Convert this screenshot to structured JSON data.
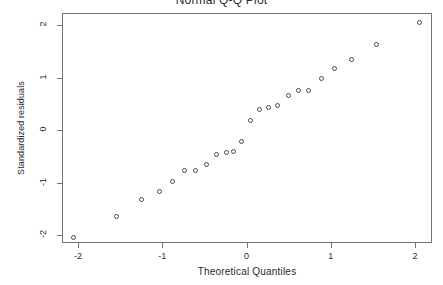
{
  "chart_data": {
    "type": "scatter",
    "title": "Normal Q-Q Plot",
    "xlabel": "Theoretical Quantiles",
    "ylabel": "Standardized residuals",
    "xlim": [
      -2.2,
      2.2
    ],
    "ylim": [
      -2.2,
      2.2
    ],
    "grid": false,
    "legend": null,
    "xticks": [
      -2,
      -1,
      0,
      1,
      2
    ],
    "xtick_labels": [
      "-2",
      "-1",
      "0",
      "1",
      "2"
    ],
    "yticks": [
      2,
      1,
      0,
      -1,
      -2
    ],
    "ytick_labels": [
      "2",
      "1",
      "0",
      "-1",
      "-2"
    ],
    "marker": "open-circle",
    "marker_color": "#4a4a4a",
    "frame_color": "#737373",
    "background": "#ffffff",
    "n_points": 24,
    "points": [
      {
        "x": -2.05,
        "y": -2.05
      },
      {
        "x": -1.54,
        "y": -1.64
      },
      {
        "x": -1.25,
        "y": -1.33
      },
      {
        "x": -1.03,
        "y": -1.17
      },
      {
        "x": -0.88,
        "y": -0.99
      },
      {
        "x": -0.73,
        "y": -0.77
      },
      {
        "x": -0.61,
        "y": -0.77
      },
      {
        "x": -0.48,
        "y": -0.65
      },
      {
        "x": -0.36,
        "y": -0.46
      },
      {
        "x": -0.24,
        "y": -0.42
      },
      {
        "x": -0.15,
        "y": -0.4
      },
      {
        "x": -0.06,
        "y": -0.21
      },
      {
        "x": 0.05,
        "y": 0.18
      },
      {
        "x": 0.15,
        "y": 0.39
      },
      {
        "x": 0.26,
        "y": 0.42
      },
      {
        "x": 0.37,
        "y": 0.46
      },
      {
        "x": 0.5,
        "y": 0.65
      },
      {
        "x": 0.62,
        "y": 0.76
      },
      {
        "x": 0.74,
        "y": 0.76
      },
      {
        "x": 0.89,
        "y": 0.98
      },
      {
        "x": 1.04,
        "y": 1.17
      },
      {
        "x": 1.25,
        "y": 1.34
      },
      {
        "x": 1.54,
        "y": 1.63
      },
      {
        "x": 2.05,
        "y": 2.05
      }
    ]
  }
}
